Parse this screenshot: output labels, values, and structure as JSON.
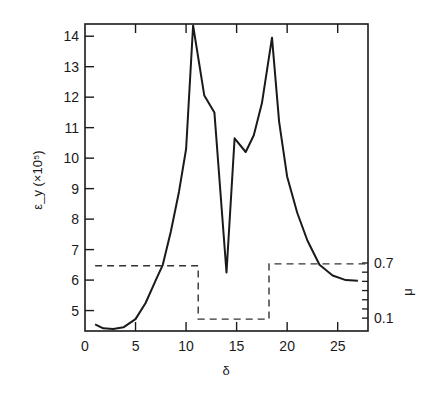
{
  "chart_data": {
    "type": "line",
    "title": "",
    "xlabel": "δ",
    "ylabel": "ε_y (×10⁵)",
    "y2label": "μ",
    "xlim": [
      0,
      28
    ],
    "ylim": [
      4.33,
      14.4
    ],
    "y2lim": [
      -0.04,
      3.3
    ],
    "grid": false,
    "legend": null,
    "x_ticks": [
      0,
      5,
      10,
      15,
      20,
      25
    ],
    "y_ticks": [
      5,
      6,
      7,
      8,
      9,
      10,
      11,
      12,
      13,
      14
    ],
    "y2_ticks": [
      0.1,
      0.2,
      0.3,
      0.4,
      0.5,
      0.6,
      0.7
    ],
    "y2_tick_labels": [
      {
        "value": 0.1,
        "label": "0.1"
      },
      {
        "value": 0.7,
        "label": "0.7"
      }
    ],
    "series": [
      {
        "name": "ε_y",
        "axis": "left",
        "style": "solid",
        "x": [
          1.0,
          1.8,
          2.8,
          3.8,
          5.0,
          6.0,
          7.0,
          7.7,
          8.5,
          9.3,
          10.0,
          10.7,
          11.8,
          12.8,
          14.0,
          14.8,
          15.9,
          16.7,
          17.5,
          18.5,
          19.2,
          20.0,
          21.0,
          22.0,
          23.2,
          24.5,
          25.8,
          27.0
        ],
        "values": [
          4.55,
          4.42,
          4.4,
          4.45,
          4.72,
          5.25,
          6.0,
          6.5,
          7.6,
          8.9,
          10.3,
          14.35,
          12.05,
          11.5,
          6.25,
          10.65,
          10.2,
          10.75,
          11.8,
          13.95,
          11.2,
          9.4,
          8.2,
          7.3,
          6.5,
          6.15,
          6.0,
          5.98
        ]
      },
      {
        "name": "μ",
        "axis": "right",
        "style": "dashed",
        "x": [
          1.0,
          11.2,
          11.2,
          18.2,
          18.2,
          28.0
        ],
        "values": [
          0.67,
          0.67,
          0.09,
          0.09,
          0.69,
          0.69
        ]
      }
    ]
  }
}
